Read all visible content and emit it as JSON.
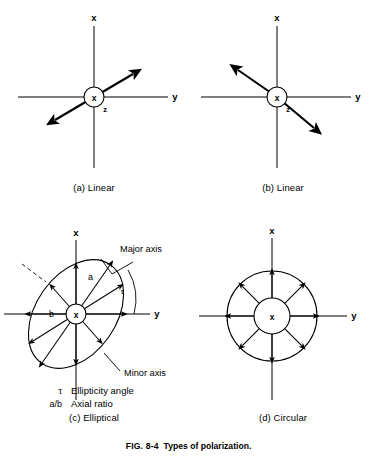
{
  "figure": {
    "number": "FIG. 8-4",
    "caption": "Types of polarization."
  },
  "axes": {
    "x_label": "x",
    "y_label": "y",
    "z_label": "z",
    "hub_label": "x"
  },
  "panels": [
    {
      "id": "a",
      "caption": "(a) Linear",
      "type": "linear",
      "field_orientation_deg": 30,
      "arrow_directions": [
        "upper-right",
        "lower-left"
      ]
    },
    {
      "id": "b",
      "caption": "(b) Linear",
      "type": "linear",
      "field_orientation_deg": 140,
      "arrow_directions": [
        "upper-left",
        "lower-right"
      ]
    },
    {
      "id": "c",
      "caption": "(c) Elliptical",
      "type": "elliptical",
      "annotations": {
        "major_axis": "Major axis",
        "minor_axis": "Minor axis",
        "semi_major": "a",
        "semi_minor": "b",
        "tilt_angle_symbol": "τ"
      }
    },
    {
      "id": "d",
      "caption": "(d) Circular",
      "type": "circular",
      "arrow_count": 8
    }
  ],
  "legend": [
    {
      "symbol": "τ",
      "text": "Ellipticity angle"
    },
    {
      "symbol": "a/b",
      "text": "Axial ratio"
    }
  ],
  "colors": {
    "ink": "#000000",
    "paper": "#ffffff"
  }
}
